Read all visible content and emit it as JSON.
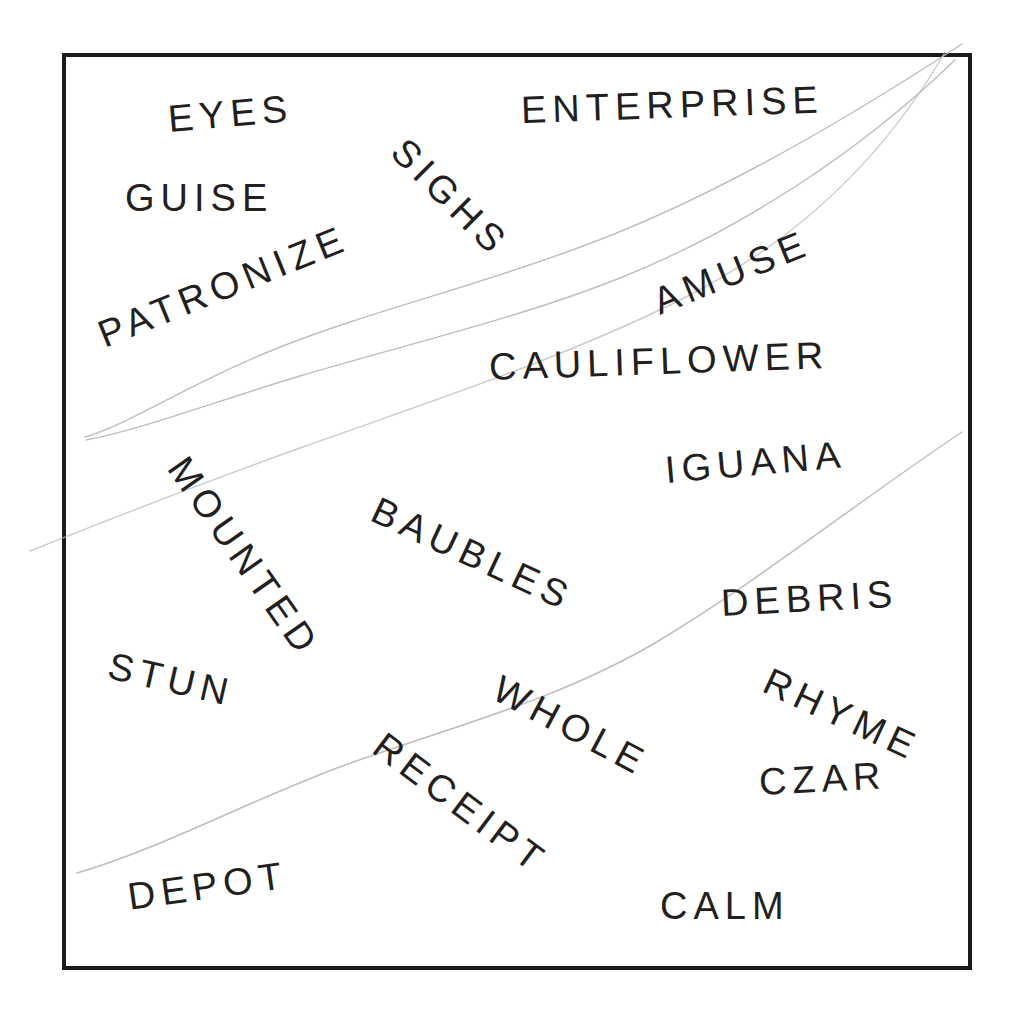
{
  "sheet": {
    "background_color": "#ffffff",
    "frame_color": "#1a1a1a",
    "text_color": "#231f20",
    "pencil_color": "#b9b9b9",
    "title": "Word Sheet"
  },
  "words": [
    {
      "text": "EYES",
      "x": 168,
      "y": 119,
      "rotation": -5,
      "size": 38,
      "spacing": 6
    },
    {
      "text": "ENTERPRISE",
      "x": 521,
      "y": 110,
      "rotation": -2,
      "size": 38,
      "spacing": 6
    },
    {
      "text": "GUISE",
      "x": 125,
      "y": 198,
      "rotation": 0,
      "size": 38,
      "spacing": 6
    },
    {
      "text": "SIGHS",
      "x": 398,
      "y": 145,
      "rotation": 45,
      "size": 38,
      "spacing": 6
    },
    {
      "text": "PATRONIZE",
      "x": 100,
      "y": 336,
      "rotation": -22,
      "size": 38,
      "spacing": 6
    },
    {
      "text": "AMUSE",
      "x": 655,
      "y": 303,
      "rotation": -22,
      "size": 38,
      "spacing": 6
    },
    {
      "text": "CAULIFLOWER",
      "x": 489,
      "y": 367,
      "rotation": -2,
      "size": 38,
      "spacing": 6
    },
    {
      "text": "MOUNTED",
      "x": 177,
      "y": 461,
      "rotation": 55,
      "size": 38,
      "spacing": 6
    },
    {
      "text": "BAUBLES",
      "x": 374,
      "y": 508,
      "rotation": 25,
      "size": 38,
      "spacing": 6
    },
    {
      "text": "IGUANA",
      "x": 665,
      "y": 470,
      "rotation": -5,
      "size": 38,
      "spacing": 6
    },
    {
      "text": "DEBRIS",
      "x": 721,
      "y": 603,
      "rotation": -3,
      "size": 38,
      "spacing": 6
    },
    {
      "text": "STUN",
      "x": 109,
      "y": 665,
      "rotation": 13,
      "size": 38,
      "spacing": 6
    },
    {
      "text": "WHOLE",
      "x": 496,
      "y": 686,
      "rotation": 28,
      "size": 38,
      "spacing": 6
    },
    {
      "text": "RHYME",
      "x": 766,
      "y": 679,
      "rotation": 25,
      "size": 38,
      "spacing": 6
    },
    {
      "text": "CZAR",
      "x": 759,
      "y": 782,
      "rotation": -3,
      "size": 38,
      "spacing": 6
    },
    {
      "text": "RECEIPT",
      "x": 378,
      "y": 741,
      "rotation": 37,
      "size": 38,
      "spacing": 6
    },
    {
      "text": "DEPOT",
      "x": 128,
      "y": 897,
      "rotation": -8,
      "size": 38,
      "spacing": 6
    },
    {
      "text": "CALM",
      "x": 660,
      "y": 906,
      "rotation": 0,
      "size": 38,
      "spacing": 6
    }
  ],
  "pencil_marks": [
    {
      "name": "upper-stroke-a",
      "path": "M 85 437 C 130 424, 185 386, 268 352 C 360 314, 470 288, 575 249 C 700 204, 830 130, 962 44"
    },
    {
      "name": "upper-stroke-b",
      "path": "M 86 440 C 140 430, 210 403, 300 376 C 400 346, 520 318, 620 278 C 740 230, 860 152, 955 60"
    },
    {
      "name": "upper-stroke-c",
      "path": "M 30 551 C 110 519, 200 484, 300 448 C 420 405, 560 360, 680 300 C 790 245, 880 165, 945 52"
    },
    {
      "name": "lower-stroke",
      "path": "M 77 873 C 160 849, 250 800, 345 765 C 450 727, 560 700, 660 640 C 760 580, 860 500, 962 432"
    }
  ]
}
